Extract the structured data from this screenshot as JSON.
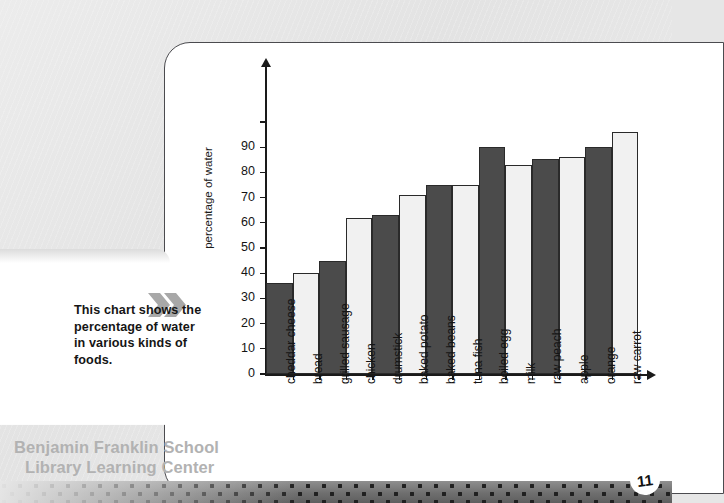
{
  "page": {
    "number": "11",
    "background_color": "#e6e6e6"
  },
  "caption": {
    "text": "This chart shows the percentage of water in various kinds of foods.",
    "chevron_icon": "double-chevron-right-icon"
  },
  "library_stamp": {
    "line1": "Benjamin Franklin School",
    "line2": "Library Learning Center"
  },
  "chart_data": {
    "type": "bar",
    "title": "",
    "xlabel": "",
    "ylabel": "percentage of water",
    "ylim": [
      0,
      100
    ],
    "ytick_step": 10,
    "grid": false,
    "legend": "none",
    "bar_colors": [
      "#4b4b4b",
      "#f1f1f1"
    ],
    "ytick_labels": [
      "0",
      "10",
      "20",
      "30",
      "40",
      "50",
      "60",
      "70",
      "80",
      "90"
    ],
    "categories": [
      "cheddar cheese",
      "bread",
      "grilled sausage",
      "chicken",
      "drumstick",
      "baked potato",
      "baked beans",
      "tuna fish",
      "boiled egg",
      "milk",
      "raw peach",
      "apple",
      "orange",
      "raw carrot"
    ],
    "values": [
      36,
      40,
      45,
      62,
      63,
      71,
      75,
      75,
      90,
      83,
      85.5,
      86,
      90,
      96
    ]
  }
}
